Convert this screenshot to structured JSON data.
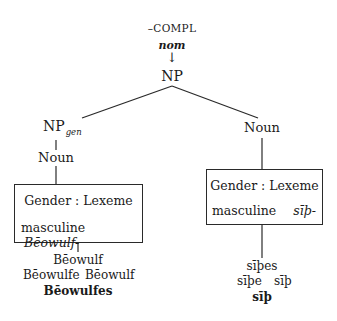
{
  "diagram": {
    "root_feature": "–COMPL",
    "root_case": "nom",
    "arrow": "↓",
    "root_node": "NP",
    "left_branch": {
      "node": "NP",
      "node_subscript": "gen",
      "child": "Noun",
      "box": {
        "header": "Gender : Lexeme",
        "gender": "masculine",
        "lexeme": "Bēowulf-"
      },
      "forms": {
        "line1": "Bēowulf",
        "line2_left": "Bēowulfe",
        "line2_right": "Bēowulf",
        "selected": "Bēowulfes"
      }
    },
    "right_branch": {
      "node": "Noun",
      "box": {
        "header": "Gender : Lexeme",
        "gender": "masculine",
        "lexeme": "sīþ-"
      },
      "forms": {
        "line1": "sīþes",
        "line2_left": "sīþe",
        "line2_right": "sīþ",
        "selected": "sīþ"
      }
    }
  }
}
